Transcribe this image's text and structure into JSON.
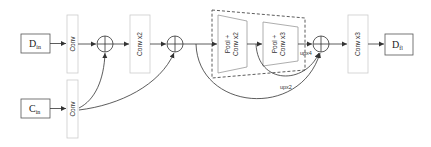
{
  "diagram": {
    "inputs": {
      "d_in": {
        "main": "D",
        "sub": "in"
      },
      "c_in": {
        "main": "C",
        "sub": "in"
      }
    },
    "output": {
      "main": "D",
      "sub": "fl"
    },
    "blocks": {
      "conv_top": "Conv",
      "conv_bottom": "Conv",
      "conv_x2": "Conv x2",
      "pool_conv_x2_line1": "Pool +",
      "pool_conv_x2_line2": "Conv x2",
      "pool_conv_x3_line1": "Pool +",
      "pool_conv_x3_line2": "Conv x3",
      "conv_x3": "Conv x3"
    },
    "edge_labels": {
      "upx4": "upx4",
      "upx2": "upx2"
    },
    "colors": {
      "stroke": "#333333",
      "light_box": "#cccccc",
      "dashed": "#333333"
    }
  }
}
